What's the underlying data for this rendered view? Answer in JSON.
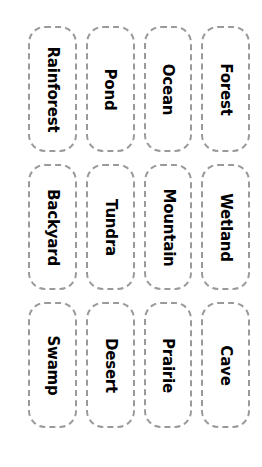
{
  "page": {
    "background_color": "#ffffff",
    "card_border_color": "#9a9a9a",
    "card_background_color": "#ffffff",
    "label_color": "#000000",
    "label_orientation": "rotated-90-clockwise"
  },
  "grid": {
    "columns": 4,
    "rows": 3,
    "rows_data": [
      {
        "cards": [
          {
            "label": "Rainforest"
          },
          {
            "label": "Pond"
          },
          {
            "label": "Ocean"
          },
          {
            "label": "Forest"
          }
        ]
      },
      {
        "cards": [
          {
            "label": "Backyard"
          },
          {
            "label": "Tundra"
          },
          {
            "label": "Mountain"
          },
          {
            "label": "Wetland"
          }
        ]
      },
      {
        "cards": [
          {
            "label": "Swamp"
          },
          {
            "label": "Desert"
          },
          {
            "label": "Prairie"
          },
          {
            "label": "Cave"
          }
        ]
      }
    ]
  }
}
